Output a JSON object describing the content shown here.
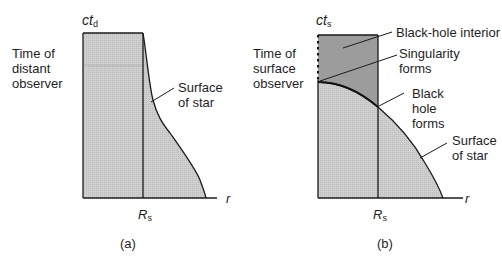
{
  "panel_a": {
    "caption": "(a)",
    "y_axis_label": "ct",
    "y_axis_subscript": "d",
    "x_axis_label": "r",
    "radius_label": "R",
    "radius_subscript": "s",
    "side_label_lines": [
      "Time of",
      "distant",
      "observer"
    ],
    "annotation_surface_lines": [
      "Surface",
      "of star"
    ],
    "fill_color": "#c9c9c9"
  },
  "panel_b": {
    "caption": "(b)",
    "y_axis_label": "ct",
    "y_axis_subscript": "s",
    "x_axis_label": "r",
    "radius_label": "R",
    "radius_subscript": "s",
    "side_label_lines": [
      "Time of",
      "surface",
      "observer"
    ],
    "annotation_interior": "Black-hole interior",
    "annotation_singularity_lines": [
      "Singularity",
      "forms"
    ],
    "annotation_blackhole_lines": [
      "Black",
      "hole",
      "forms"
    ],
    "annotation_surface_lines": [
      "Surface",
      "of star"
    ],
    "interior_color": "#9c9c9c",
    "star_fill_color": "#cbcbcb"
  }
}
